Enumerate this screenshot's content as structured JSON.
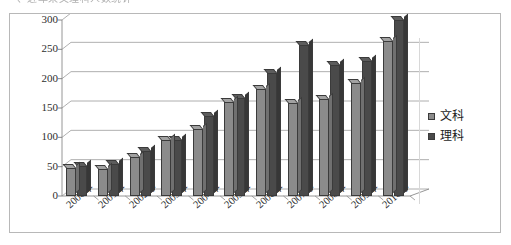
{
  "top_clipped_text": "一、近年来文理科人数统计",
  "chart_data": {
    "type": "bar",
    "title": "",
    "subtitle": "",
    "xlabel": "",
    "ylabel": "",
    "ylim": [
      0,
      300
    ],
    "yticks": [
      0,
      50,
      100,
      150,
      200,
      250,
      300
    ],
    "ytick_labels": [
      "0",
      "50",
      "100",
      "150",
      "200",
      "250",
      "300"
    ],
    "grid": true,
    "grid_axis": "y",
    "legend_position": "right",
    "style": "3d-clustered-column",
    "categories": [
      "2000年",
      "2001年",
      "2002年",
      "2003年",
      "2004年",
      "2005年",
      "2006年",
      "2007年",
      "2008年",
      "2009年",
      "2010年"
    ],
    "series": [
      {
        "name": "文科",
        "color": "#8b8b8b",
        "values": [
          47,
          46,
          67,
          95,
          114,
          160,
          183,
          159,
          166,
          193,
          265
        ]
      },
      {
        "name": "理科",
        "color": "#4a4a4a",
        "values": [
          51,
          54,
          76,
          96,
          137,
          167,
          210,
          257,
          223,
          230,
          300
        ]
      }
    ]
  },
  "legend": {
    "items": [
      {
        "label": "文科",
        "color": "#8b8b8b"
      },
      {
        "label": "理科",
        "color": "#4a4a4a"
      }
    ]
  }
}
